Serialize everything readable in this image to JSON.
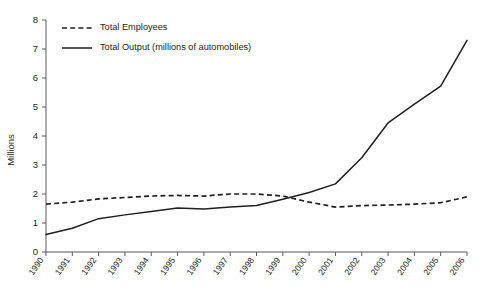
{
  "chart_data": {
    "type": "line",
    "title": "",
    "subtitle": "",
    "xlabel": "",
    "ylabel": "Millions",
    "x": [
      1990,
      1991,
      1992,
      1993,
      1994,
      1995,
      1996,
      1997,
      1998,
      1999,
      2000,
      2001,
      2002,
      2003,
      2004,
      2005,
      2006
    ],
    "categories": [
      "1990",
      "1991",
      "1992",
      "1993",
      "1994",
      "1995",
      "1996",
      "1997",
      "1998",
      "1999",
      "2000",
      "2001",
      "2002",
      "2003",
      "2004",
      "2005",
      "2006"
    ],
    "xlim": [
      1990,
      2006
    ],
    "ylim": [
      0,
      8
    ],
    "yticks": [
      0,
      1,
      2,
      3,
      4,
      5,
      6,
      7,
      8
    ],
    "ytick_labels": [
      "0",
      "1",
      "2",
      "3",
      "4",
      "5",
      "6",
      "7",
      "8"
    ],
    "grid": false,
    "legend_position": "top-left",
    "series": [
      {
        "name": "Total Employees",
        "style": "dashed",
        "color": "#231f20",
        "values": [
          1.65,
          1.72,
          1.83,
          1.88,
          1.93,
          1.95,
          1.93,
          2.0,
          2.0,
          1.93,
          1.72,
          1.55,
          1.6,
          1.62,
          1.65,
          1.7,
          1.9
        ]
      },
      {
        "name": "Total Output (millions of automobiles)",
        "style": "solid",
        "color": "#231f20",
        "values": [
          0.6,
          0.82,
          1.15,
          1.28,
          1.4,
          1.52,
          1.48,
          1.55,
          1.6,
          1.82,
          2.05,
          2.35,
          3.25,
          4.45,
          5.1,
          5.72,
          7.3
        ]
      }
    ],
    "legend": [
      {
        "label": "Total Employees",
        "style": "dashed"
      },
      {
        "label": "Total Output (millions of automobiles)",
        "style": "solid"
      }
    ]
  }
}
